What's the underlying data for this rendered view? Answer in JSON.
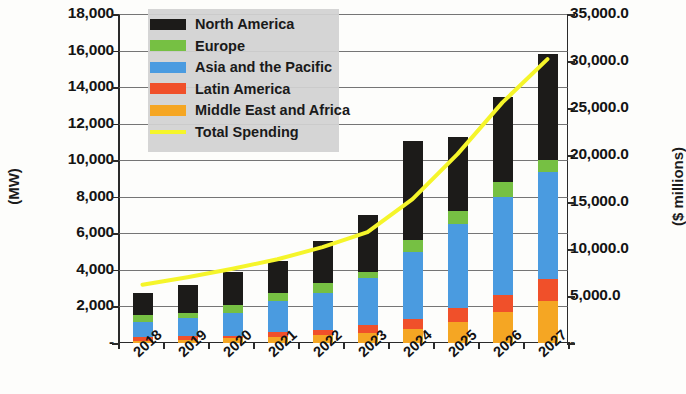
{
  "chart_data": {
    "type": "bar",
    "title": "",
    "subtitle": "",
    "stacked": true,
    "grid": true,
    "legend_position": "top-left-inside",
    "xlabel": "",
    "ylabel": "(MW)",
    "y2label": "($ millions)",
    "categories": [
      "2018",
      "2019",
      "2020",
      "2021",
      "2022",
      "2023",
      "2024",
      "2025",
      "2026",
      "2027"
    ],
    "ylim": [
      0,
      18000
    ],
    "yticks": [
      0,
      2000,
      4000,
      6000,
      8000,
      10000,
      12000,
      14000,
      16000,
      18000
    ],
    "ytick_labels": [
      "-",
      "2,000",
      "4,000",
      "6,000",
      "8,000",
      "10,000",
      "12,000",
      "14,000",
      "16,000",
      "18,000"
    ],
    "y2lim": [
      0,
      35000
    ],
    "y2ticks": [
      0,
      5000,
      10000,
      15000,
      20000,
      25000,
      30000,
      35000
    ],
    "y2tick_labels": [
      "-",
      "5,000.0",
      "10,000.0",
      "15,000.0",
      "20,000.0",
      "25,000.0",
      "30,000.0",
      "35,000.0"
    ],
    "series": [
      {
        "name": "Middle East and Africa",
        "color": "#F5A623",
        "axis": "left",
        "values": [
          100,
          140,
          260,
          330,
          430,
          560,
          780,
          1150,
          1700,
          2300
        ]
      },
      {
        "name": "Latin America",
        "color": "#F0502A",
        "axis": "left",
        "values": [
          210,
          230,
          140,
          270,
          270,
          430,
          560,
          790,
          930,
          1180
        ]
      },
      {
        "name": "Asia and the Pacific",
        "color": "#4A9BE0",
        "axis": "left",
        "values": [
          840,
          1010,
          1250,
          1700,
          2040,
          2580,
          3660,
          4560,
          5350,
          5860
        ]
      },
      {
        "name": "Europe",
        "color": "#76C043",
        "axis": "left",
        "values": [
          390,
          280,
          420,
          450,
          520,
          340,
          640,
          740,
          810,
          700
        ]
      },
      {
        "name": "North America",
        "color": "#1C1B19",
        "axis": "left",
        "values": [
          1210,
          1540,
          1790,
          1750,
          2300,
          3080,
          5420,
          4030,
          4660,
          5760
        ]
      }
    ],
    "totals": [
      2750,
      3200,
      3860,
      4500,
      5560,
      6990,
      11060,
      11270,
      13450,
      15800
    ],
    "line_series": {
      "name": "Total Spending",
      "color": "#F5F52A",
      "axis": "right",
      "values": [
        6200,
        7000,
        7900,
        8900,
        10200,
        11800,
        15300,
        20100,
        25600,
        30200
      ]
    }
  },
  "legend": {
    "items": [
      {
        "label": "North America",
        "color": "#1C1B19",
        "marker": "box"
      },
      {
        "label": "Europe",
        "color": "#76C043",
        "marker": "box"
      },
      {
        "label": "Asia and the Pacific",
        "color": "#4A9BE0",
        "marker": "box"
      },
      {
        "label": "Latin America",
        "color": "#F0502A",
        "marker": "box"
      },
      {
        "label": "Middle East and Africa",
        "color": "#F5A623",
        "marker": "box"
      },
      {
        "label": "Total Spending",
        "color": "#F5F52A",
        "marker": "line"
      }
    ]
  }
}
